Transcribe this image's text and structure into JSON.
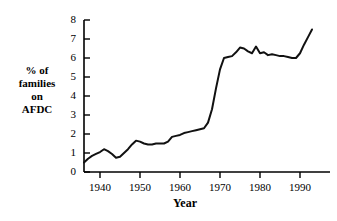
{
  "chart_data": {
    "type": "line",
    "title": "",
    "xlabel": "Year",
    "ylabel": "% of families on AFDC",
    "ylabel_lines": [
      "% of",
      "families",
      "on",
      "AFDC"
    ],
    "xlim": [
      1936,
      1993
    ],
    "ylim": [
      0,
      8
    ],
    "grid": false,
    "legend": null,
    "line_color": "#111111",
    "axis_color": "#000000",
    "xticks": [
      1940,
      1950,
      1960,
      1970,
      1980,
      1990
    ],
    "xtick_labels": [
      "1940",
      "1950",
      "1960",
      "1970",
      "1980",
      "1990"
    ],
    "yticks": [
      0,
      1,
      2,
      3,
      4,
      5,
      6,
      7,
      8
    ],
    "ytick_labels": [
      "0",
      "1",
      "2",
      "3",
      "4",
      "5",
      "6",
      "7",
      "8"
    ],
    "series": [
      {
        "name": "% of families on AFDC",
        "x": [
          1936,
          1937,
          1938,
          1939,
          1940,
          1941,
          1942,
          1943,
          1944,
          1945,
          1946,
          1947,
          1948,
          1949,
          1950,
          1951,
          1952,
          1953,
          1954,
          1955,
          1956,
          1957,
          1958,
          1959,
          1960,
          1961,
          1962,
          1963,
          1964,
          1965,
          1966,
          1967,
          1968,
          1969,
          1970,
          1971,
          1972,
          1973,
          1974,
          1975,
          1976,
          1977,
          1978,
          1979,
          1980,
          1981,
          1982,
          1983,
          1984,
          1985,
          1986,
          1987,
          1988,
          1989,
          1990,
          1991,
          1992,
          1993
        ],
        "values": [
          0.5,
          0.7,
          0.85,
          0.95,
          1.05,
          1.2,
          1.1,
          0.95,
          0.75,
          0.8,
          1.0,
          1.2,
          1.45,
          1.65,
          1.6,
          1.5,
          1.45,
          1.45,
          1.5,
          1.5,
          1.5,
          1.6,
          1.85,
          1.9,
          1.95,
          2.05,
          2.1,
          2.15,
          2.2,
          2.25,
          2.3,
          2.6,
          3.3,
          4.4,
          5.4,
          6.0,
          6.05,
          6.1,
          6.3,
          6.55,
          6.5,
          6.35,
          6.25,
          6.6,
          6.25,
          6.3,
          6.15,
          6.2,
          6.15,
          6.1,
          6.1,
          6.05,
          6.0,
          6.0,
          6.25,
          6.7,
          7.1,
          7.5
        ]
      }
    ]
  }
}
